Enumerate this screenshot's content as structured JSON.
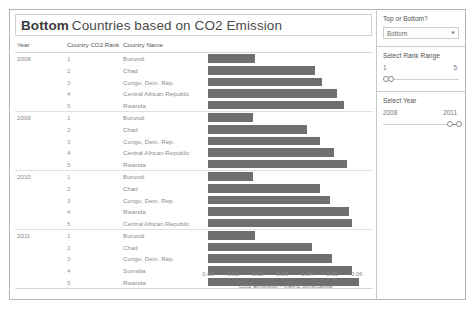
{
  "title": {
    "parameter": "Bottom",
    "rest": "Countries based on  CO2 Emission"
  },
  "table": {
    "columns": [
      "Year",
      "Country CO2 Rank",
      "Country Name"
    ]
  },
  "filters": {
    "top_bottom": {
      "label": "Top or Bottom?",
      "value": "Bottom",
      "caret": "chevron-down-icon"
    },
    "rank_range": {
      "label": "Select Rank Range",
      "min": "1",
      "max": "5",
      "handle_low_pct": 0,
      "handle_high_pct": 6
    },
    "year_range": {
      "label": "Select Year",
      "min": "2008",
      "max": "2011",
      "handle_low_pct": 84,
      "handle_high_pct": 96
    }
  },
  "chart_data": {
    "type": "bar",
    "title": "Bottom Countries based on  CO2 Emission",
    "xlabel": "CO2 Emission - metric tons/capita",
    "ylabel": "",
    "xlim": [
      0,
      0.0625
    ],
    "xticks": [
      0.0,
      0.01,
      0.02,
      0.03,
      0.04,
      0.05,
      0.06
    ],
    "xticklabels": [
      "0.00",
      "0.01",
      "0.02",
      "0.03",
      "0.04",
      "0.05",
      "0.06"
    ],
    "grid": false,
    "legend": null,
    "orientation": "horizontal",
    "groups": [
      {
        "year": "2008",
        "rows": [
          {
            "rank": "1",
            "country": "Burundi",
            "value": 0.019
          },
          {
            "rank": "2",
            "country": "Chad",
            "value": 0.043
          },
          {
            "rank": "3",
            "country": "Congo, Dem. Rep.",
            "value": 0.046
          },
          {
            "rank": "4",
            "country": "Central African Republic",
            "value": 0.052
          },
          {
            "rank": "5",
            "country": "Rwanda",
            "value": 0.055
          }
        ]
      },
      {
        "year": "2009",
        "rows": [
          {
            "rank": "1",
            "country": "Burundi",
            "value": 0.018
          },
          {
            "rank": "2",
            "country": "Chad",
            "value": 0.04
          },
          {
            "rank": "3",
            "country": "Congo, Dem. Rep.",
            "value": 0.045
          },
          {
            "rank": "4",
            "country": "Central African Republic",
            "value": 0.051
          },
          {
            "rank": "5",
            "country": "Rwanda",
            "value": 0.056
          }
        ]
      },
      {
        "year": "2010",
        "rows": [
          {
            "rank": "1",
            "country": "Burundi",
            "value": 0.018
          },
          {
            "rank": "2",
            "country": "Chad",
            "value": 0.045
          },
          {
            "rank": "3",
            "country": "Congo, Dem. Rep.",
            "value": 0.049
          },
          {
            "rank": "4",
            "country": "Rwanda",
            "value": 0.057
          },
          {
            "rank": "5",
            "country": "Central African Republic",
            "value": 0.058
          }
        ]
      },
      {
        "year": "2011",
        "rows": [
          {
            "rank": "1",
            "country": "Burundi",
            "value": 0.019
          },
          {
            "rank": "2",
            "country": "Chad",
            "value": 0.042
          },
          {
            "rank": "3",
            "country": "Congo, Dem. Rep.",
            "value": 0.05
          },
          {
            "rank": "4",
            "country": "Somalia",
            "value": 0.058
          },
          {
            "rank": "5",
            "country": "Rwanda",
            "value": 0.061
          }
        ]
      }
    ],
    "bar_color": "#6f6f6f"
  }
}
